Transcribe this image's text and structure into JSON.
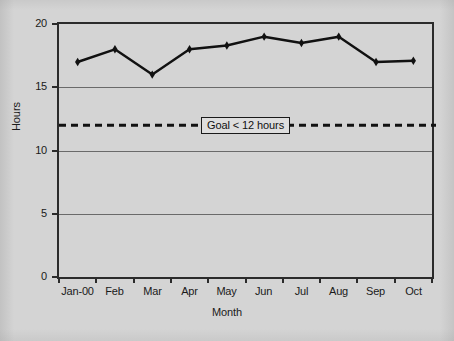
{
  "chart_data": {
    "type": "line",
    "title": "",
    "xlabel": "Month",
    "ylabel": "Hours",
    "categories": [
      "Jan-00",
      "Feb",
      "Mar",
      "Apr",
      "May",
      "Jun",
      "Jul",
      "Aug",
      "Sep",
      "Oct"
    ],
    "values": [
      17.0,
      18.0,
      16.0,
      18.0,
      18.3,
      19.0,
      18.5,
      19.0,
      17.0,
      17.1
    ],
    "series": [
      {
        "name": "Hours",
        "values": [
          17.0,
          18.0,
          16.0,
          18.0,
          18.3,
          19.0,
          18.5,
          19.0,
          17.0,
          17.1
        ],
        "marker": "diamond",
        "color": "#111111"
      }
    ],
    "ylim": [
      0,
      20
    ],
    "yticks": [
      0,
      5,
      10,
      15,
      20
    ],
    "ytick_labels": [
      "0",
      "5",
      "10",
      "15",
      "20"
    ],
    "grid": true,
    "grid_axis": "y",
    "legend": "none",
    "annotations": [
      {
        "type": "threshold-line",
        "label": "Goal < 12 hours",
        "value": 12,
        "style": "dashed",
        "color": "#111111"
      }
    ]
  },
  "figure": {
    "background_color": "#d4d4d4",
    "plot_border_color": "#2b2b2b",
    "gridline_color": "#6a6a6a"
  }
}
